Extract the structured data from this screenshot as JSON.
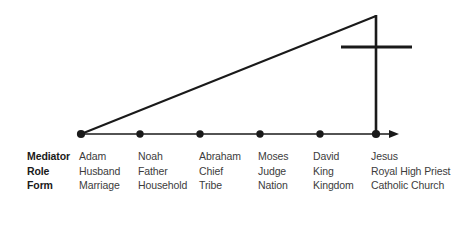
{
  "figure": {
    "type": "timeline-diagram",
    "axis": {
      "start_x": 81,
      "end_x": 399,
      "y": 134,
      "arrow": "right-arrow",
      "points_x": [
        81,
        140,
        200,
        260,
        320,
        376
      ]
    },
    "ascending_line": {
      "from": [
        81,
        134
      ],
      "to": [
        376,
        16
      ]
    },
    "vertical_line": {
      "x": 376,
      "from_y": 16,
      "to_y": 134
    },
    "crossbar": {
      "y": 47,
      "from_x": 341,
      "to_x": 412
    },
    "colors": {
      "stroke": "#1a1a1a",
      "label_text": "#1a1a1a",
      "cell_text": "#3c3c3c",
      "background": "#ffffff"
    }
  },
  "table": {
    "row_labels": [
      "Mediator",
      "Role",
      "Form"
    ],
    "columns": [
      {
        "mediator": "Adam",
        "role": "Husband",
        "form": "Marriage"
      },
      {
        "mediator": "Noah",
        "role": "Father",
        "form": "Household"
      },
      {
        "mediator": "Abraham",
        "role": "Chief",
        "form": "Tribe"
      },
      {
        "mediator": "Moses",
        "role": "Judge",
        "form": "Nation"
      },
      {
        "mediator": "David",
        "role": "King",
        "form": "Kingdom"
      },
      {
        "mediator": "Jesus",
        "role": "Royal High Priest",
        "form": "Catholic Church"
      }
    ]
  }
}
